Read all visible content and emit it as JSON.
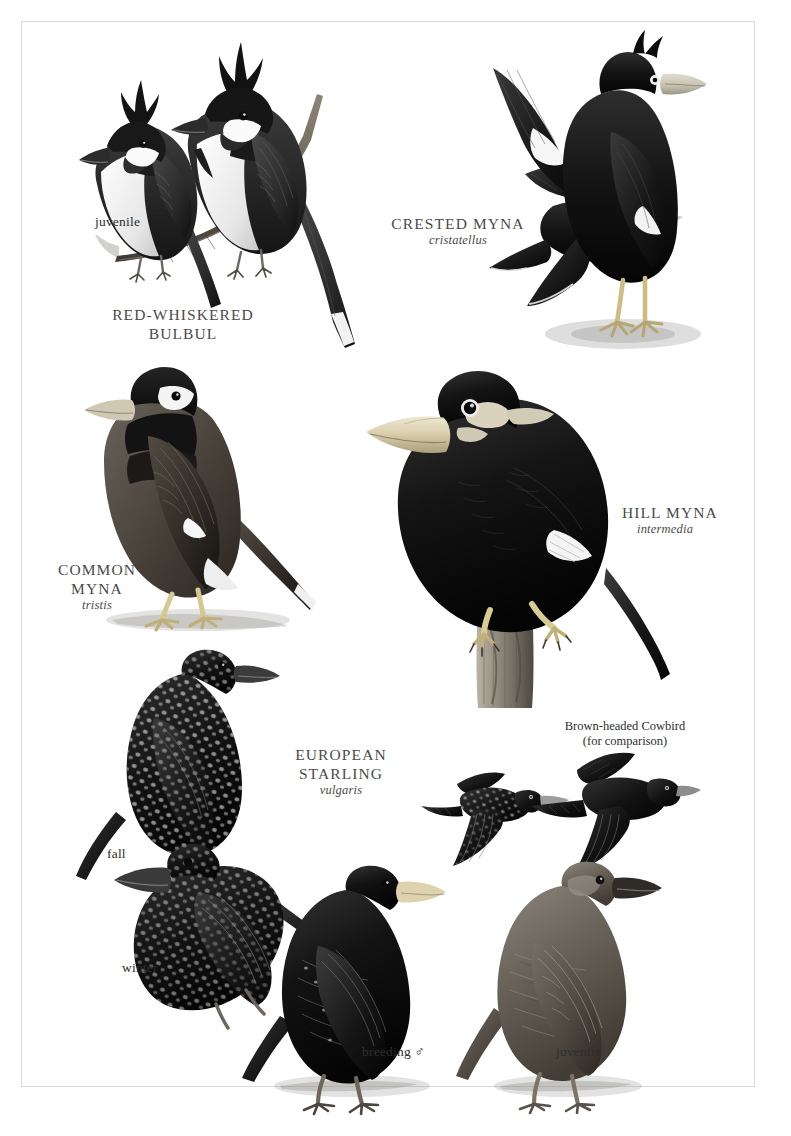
{
  "plate": {
    "title": "Mynas, Bulbul and Starlings field guide plate",
    "frame_color": "#d9d9d9",
    "background": "#ffffff"
  },
  "species": [
    {
      "id": "red-whiskered-bulbul",
      "common_name_line1": "RED-WHISKERED",
      "common_name_line2": "BULBUL",
      "scientific_name": "",
      "plumage_labels": [
        "juvenile"
      ]
    },
    {
      "id": "crested-myna",
      "common_name_line1": "CRESTED MYNA",
      "common_name_line2": "",
      "scientific_name": "cristatellus",
      "plumage_labels": []
    },
    {
      "id": "common-myna",
      "common_name_line1": "COMMON",
      "common_name_line2": "MYNA",
      "scientific_name": "tristis",
      "plumage_labels": []
    },
    {
      "id": "hill-myna",
      "common_name_line1": "HILL MYNA",
      "common_name_line2": "",
      "scientific_name": "intermedia",
      "plumage_labels": []
    },
    {
      "id": "european-starling",
      "common_name_line1": "EUROPEAN",
      "common_name_line2": "STARLING",
      "scientific_name": "vulgaris",
      "plumage_labels": [
        "fall",
        "winter",
        "breeding ♂",
        "juvenile"
      ]
    }
  ],
  "labels": {
    "bulbul_juvenile": "juvenile",
    "bulbul_name_1": "RED-WHISKERED",
    "bulbul_name_2": "BULBUL",
    "crested_myna_name": "CRESTED MYNA",
    "crested_myna_sci": "cristatellus",
    "common_myna_name_1": "COMMON",
    "common_myna_name_2": "MYNA",
    "common_myna_sci": "tristis",
    "hill_myna_name": "HILL MYNA",
    "hill_myna_sci": "intermedia",
    "starling_name_1": "EUROPEAN",
    "starling_name_2": "STARLING",
    "starling_sci": "vulgaris",
    "starling_fall": "fall",
    "starling_winter": "winter",
    "starling_breeding": "breeding ♂",
    "starling_juvenile": "juvenile",
    "cowbird_line_1": "Brown-headed Cowbird",
    "cowbird_line_2": "(for comparison)"
  },
  "illustrations": [
    {
      "name": "bulbul-juvenile-perched",
      "species": "red-whiskered-bulbul",
      "pose": "perched-on-branch",
      "notes": "smaller crest, white cheek patch"
    },
    {
      "name": "bulbul-adult-perched",
      "species": "red-whiskered-bulbul",
      "pose": "perched-on-branch",
      "notes": "tall pointed crest, dark breast band, white underparts"
    },
    {
      "name": "crested-myna-flying",
      "species": "crested-myna",
      "pose": "in-flight",
      "notes": "black with large white wing patches"
    },
    {
      "name": "crested-myna-perched",
      "species": "crested-myna",
      "pose": "standing",
      "notes": "pale bill, frontal crest, white eye, yellow legs"
    },
    {
      "name": "common-myna-standing",
      "species": "common-myna",
      "pose": "standing",
      "notes": "black hood, brown body, white wing patch, yellow bill and legs"
    },
    {
      "name": "hill-myna-perched-stump",
      "species": "hill-myna",
      "pose": "perched-on-stump",
      "notes": "orange bill, yellow nape wattles, white wing patch"
    },
    {
      "name": "starling-fall-perched",
      "species": "european-starling",
      "pose": "perched-on-branch",
      "notes": "heavily white spotted"
    },
    {
      "name": "starling-winter-perched",
      "species": "european-starling",
      "pose": "perched-on-branch",
      "notes": "spotted, dark bill"
    },
    {
      "name": "starling-breeding-male",
      "species": "european-starling",
      "pose": "standing",
      "notes": "glossy black, yellow bill"
    },
    {
      "name": "starling-juvenile",
      "species": "european-starling",
      "pose": "standing",
      "notes": "plain gray-brown, dark bill"
    },
    {
      "name": "starling-flying",
      "species": "european-starling",
      "pose": "in-flight",
      "notes": "spotted, triangular wings, short tail"
    },
    {
      "name": "cowbird-flying",
      "species": "brown-headed-cowbird",
      "pose": "in-flight",
      "notes": "plain dark, rounded wings, longer tail"
    }
  ],
  "colors": {
    "ink_black": "#111111",
    "ink_dark": "#2a2a2a",
    "mid_gray": "#5d5d5d",
    "light_gray": "#b8b8b8",
    "pale": "#e9e9e9",
    "bill_pale": "#cfc9bd",
    "bill_yellow": "#d8cfb4",
    "label_gray": "#4a4a4a"
  }
}
